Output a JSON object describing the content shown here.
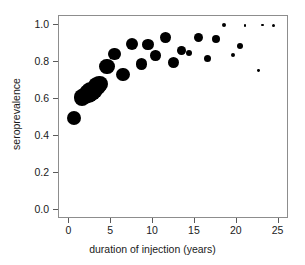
{
  "chart_data": {
    "type": "scatter",
    "title": "",
    "xlabel": "duration of injection (years)",
    "ylabel": "seroprevalence",
    "xlim": [
      -1.25,
      26.25
    ],
    "ylim": [
      -0.05,
      1.05
    ],
    "xticks": [
      0,
      5,
      10,
      15,
      20,
      25
    ],
    "xticklabels": [
      "0",
      "5",
      "10",
      "15",
      "20",
      "25"
    ],
    "yticks": [
      0.0,
      0.2,
      0.4,
      0.6,
      0.8,
      1.0
    ],
    "yticklabels": [
      "0.0",
      "0.2",
      "0.4",
      "0.6",
      "0.8",
      "1.0"
    ],
    "grid": false,
    "legend": null,
    "marker": "filled-circle",
    "marker_color": "#000000",
    "note": "marker area is proportional to group sample size",
    "points": [
      {
        "x": 0.5,
        "y": 0.5,
        "size": 7.0
      },
      {
        "x": 1.5,
        "y": 0.61,
        "size": 8.4
      },
      {
        "x": 1.9,
        "y": 0.62,
        "size": 8.6
      },
      {
        "x": 2.3,
        "y": 0.63,
        "size": 9.4
      },
      {
        "x": 2.6,
        "y": 0.64,
        "size": 9.8
      },
      {
        "x": 2.9,
        "y": 0.65,
        "size": 9.0
      },
      {
        "x": 3.3,
        "y": 0.67,
        "size": 8.8
      },
      {
        "x": 3.6,
        "y": 0.68,
        "size": 8.2
      },
      {
        "x": 4.5,
        "y": 0.775,
        "size": 7.6
      },
      {
        "x": 5.4,
        "y": 0.845,
        "size": 6.2
      },
      {
        "x": 6.4,
        "y": 0.735,
        "size": 6.6
      },
      {
        "x": 7.5,
        "y": 0.9,
        "size": 6.0
      },
      {
        "x": 8.6,
        "y": 0.79,
        "size": 5.6
      },
      {
        "x": 9.4,
        "y": 0.895,
        "size": 5.8
      },
      {
        "x": 10.3,
        "y": 0.835,
        "size": 5.2
      },
      {
        "x": 11.5,
        "y": 0.935,
        "size": 5.4
      },
      {
        "x": 12.4,
        "y": 0.8,
        "size": 5.6
      },
      {
        "x": 13.4,
        "y": 0.865,
        "size": 4.4
      },
      {
        "x": 14.3,
        "y": 0.85,
        "size": 3.4
      },
      {
        "x": 15.4,
        "y": 0.935,
        "size": 4.6
      },
      {
        "x": 16.5,
        "y": 0.82,
        "size": 3.6
      },
      {
        "x": 17.5,
        "y": 0.925,
        "size": 4.2
      },
      {
        "x": 18.5,
        "y": 1.0,
        "size": 2.0
      },
      {
        "x": 19.5,
        "y": 0.84,
        "size": 2.0
      },
      {
        "x": 20.4,
        "y": 0.89,
        "size": 3.0
      },
      {
        "x": 21.0,
        "y": 1.0,
        "size": 1.4
      },
      {
        "x": 22.6,
        "y": 0.755,
        "size": 1.4
      },
      {
        "x": 23.1,
        "y": 1.0,
        "size": 1.2
      },
      {
        "x": 24.4,
        "y": 1.0,
        "size": 1.6
      }
    ]
  }
}
